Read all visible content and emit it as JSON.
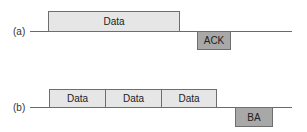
{
  "diagram": {
    "a": {
      "label": "(a)",
      "frames": [
        {
          "label": "Data"
        }
      ],
      "response": {
        "label": "ACK"
      }
    },
    "b": {
      "label": "(b)",
      "frames": [
        {
          "label": "Data"
        },
        {
          "label": "Data"
        },
        {
          "label": "Data"
        }
      ],
      "response": {
        "label": "BA"
      }
    },
    "colors": {
      "data_fill": "#e6e6e6",
      "ack_fill": "#a8a8a8",
      "line": "#6a6a6a"
    }
  }
}
